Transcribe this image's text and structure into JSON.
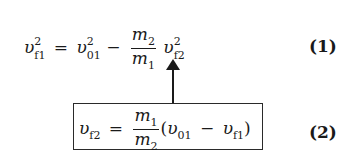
{
  "equations": [
    {
      "id": "1",
      "label": "(1)",
      "text": "v_f1^2 = v_01^2 - (m_2/m_1) v_f2^2",
      "parts": {
        "lhs_var": "υ",
        "lhs_sub": "f1",
        "lhs_sup": "2",
        "equals": "=",
        "t1_var": "υ",
        "t1_sub": "01",
        "t1_sup": "2",
        "minus": "−",
        "frac_num_var": "m",
        "frac_num_sub": "2",
        "frac_den_var": "m",
        "frac_den_sub": "1",
        "t2_var": "υ",
        "t2_sub": "f2",
        "t2_sup": "2"
      }
    },
    {
      "id": "2",
      "label": "(2)",
      "boxed": true,
      "text": "v_f2 = (m_1/m_2)(v_01 - v_f1)",
      "parts": {
        "lhs_var": "υ",
        "lhs_sub": "f2",
        "equals": "=",
        "frac_num_var": "m",
        "frac_num_sub": "1",
        "frac_den_var": "m",
        "frac_den_sub": "2",
        "lparen": "(",
        "a_var": "υ",
        "a_sub": "01",
        "minus": "−",
        "b_var": "υ",
        "b_sub": "f1",
        "rparen": ")"
      }
    }
  ],
  "annotation": {
    "arrow": "up-arrow",
    "from": "equation 2 box",
    "to": "v_f2 term in equation 1"
  }
}
